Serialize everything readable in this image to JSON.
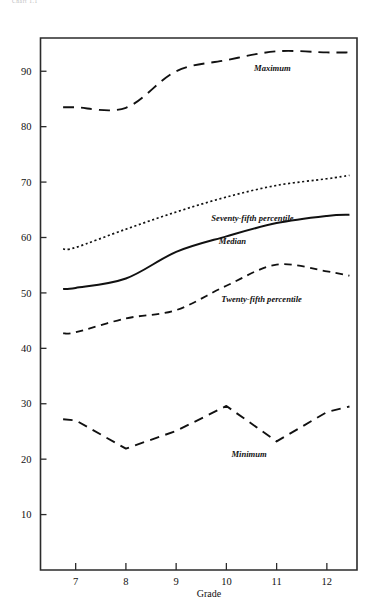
{
  "page": {
    "header_note": "Chart 1.1"
  },
  "chart_data": {
    "type": "line",
    "title": "",
    "xlabel": "Grade",
    "ylabel": "",
    "x": [
      7,
      8,
      9,
      10,
      11,
      12
    ],
    "categories": [
      "7",
      "8",
      "9",
      "10",
      "11",
      "12"
    ],
    "xlim": [
      6.3,
      12.6
    ],
    "ylim": [
      0,
      96
    ],
    "ytick_values": [
      10,
      20,
      30,
      40,
      50,
      60,
      70,
      80,
      90
    ],
    "ytick_labels": [
      "10",
      "20",
      "30",
      "40",
      "50",
      "60",
      "70",
      "80",
      "90"
    ],
    "xtick_values": [
      7,
      8,
      9,
      10,
      11,
      12
    ],
    "xtick_labels": [
      "7",
      "8",
      "9",
      "10",
      "11",
      "12"
    ],
    "grid": false,
    "legend_position": "inline-annotations",
    "series": [
      {
        "name": "Maximum",
        "label": "Maximum",
        "style": "long-dash",
        "x": [
          6.75,
          7,
          8,
          9,
          10,
          11,
          12,
          12.45
        ],
        "values": [
          83.5,
          83.5,
          83.4,
          90.0,
          92.0,
          93.6,
          93.4,
          93.4
        ],
        "label_x": 10.55,
        "label_y": 90.0
      },
      {
        "name": "Seventy-fifth percentile",
        "label": "Seventy-fifth percentile",
        "style": "dotted",
        "x": [
          6.75,
          7,
          8,
          9,
          10,
          11,
          12,
          12.45
        ],
        "values": [
          57.9,
          58.2,
          61.5,
          64.6,
          67.3,
          69.4,
          70.6,
          71.2
        ],
        "label_x": 9.7,
        "label_y": 63.0
      },
      {
        "name": "Median",
        "label": "Median",
        "style": "solid",
        "x": [
          6.75,
          7,
          8,
          9,
          10,
          11,
          12,
          12.45
        ],
        "values": [
          50.7,
          50.9,
          52.6,
          57.4,
          60.2,
          62.6,
          63.9,
          64.1
        ],
        "label_x": 9.85,
        "label_y": 58.8
      },
      {
        "name": "Twenty-fifth percentile",
        "label": "Twenty-fifth percentile",
        "style": "dash",
        "x": [
          6.75,
          7,
          8,
          9,
          10,
          11,
          12,
          12.45
        ],
        "values": [
          42.7,
          42.9,
          45.4,
          46.9,
          51.3,
          55.1,
          53.9,
          53.1
        ],
        "label_x": 9.9,
        "label_y": 48.3
      },
      {
        "name": "Minimum",
        "label": "Minimum",
        "style": "long-dash",
        "x": [
          6.75,
          7,
          8,
          9,
          10,
          11,
          12,
          12.45
        ],
        "values": [
          27.2,
          27.0,
          21.9,
          25.1,
          29.6,
          23.2,
          28.5,
          29.5
        ],
        "label_x": 10.1,
        "label_y": 20.4
      }
    ]
  }
}
